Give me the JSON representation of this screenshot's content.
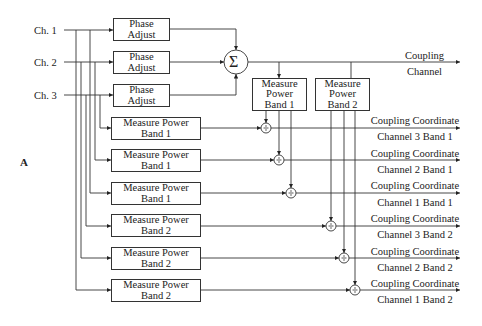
{
  "figure_label": "A",
  "inputs": [
    {
      "label": "Ch. 1"
    },
    {
      "label": "Ch. 2"
    },
    {
      "label": "Ch. 3"
    }
  ],
  "phase_adjust": [
    {
      "line1": "Phase",
      "line2": "Adjust"
    },
    {
      "line1": "Phase",
      "line2": "Adjust"
    },
    {
      "line1": "Phase",
      "line2": "Adjust"
    }
  ],
  "summer": {
    "symbol": "Σ"
  },
  "coupling_output": {
    "line1": "Coupling",
    "line2": "Channel"
  },
  "coupling_power": [
    {
      "line1": "Measure",
      "line2": "Power",
      "line3": "Band 1"
    },
    {
      "line1": "Measure",
      "line2": "Power",
      "line3": "Band 2"
    }
  ],
  "channel_power": [
    {
      "line1": "Measure Power",
      "line2": "Band 1"
    },
    {
      "line1": "Measure Power",
      "line2": "Band 1"
    },
    {
      "line1": "Measure Power",
      "line2": "Band 1"
    },
    {
      "line1": "Measure Power",
      "line2": "Band 2"
    },
    {
      "line1": "Measure Power",
      "line2": "Band 2"
    },
    {
      "line1": "Measure Power",
      "line2": "Band 2"
    }
  ],
  "divider": {
    "symbol": "÷"
  },
  "outputs": [
    {
      "line1": "Coupling Coordinate",
      "line2": "Channel 3 Band 1"
    },
    {
      "line1": "Coupling Coordinate",
      "line2": "Channel 2 Band 1"
    },
    {
      "line1": "Coupling Coordinate",
      "line2": "Channel 1 Band 1"
    },
    {
      "line1": "Coupling Coordinate",
      "line2": "Channel 3 Band 2"
    },
    {
      "line1": "Coupling Coordinate",
      "line2": "Channel 2 Band 2"
    },
    {
      "line1": "Coupling Coordinate",
      "line2": "Channel 1 Band 2"
    }
  ]
}
